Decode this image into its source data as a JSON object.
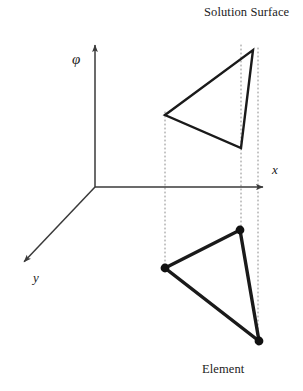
{
  "figure": {
    "width": 303,
    "height": 391,
    "background": "#ffffff",
    "line_color": "#1a1a1a",
    "axis_color": "#3a3a3a",
    "dotted_color": "#8a8a8a",
    "node_color": "#111111"
  },
  "labels": {
    "solution_surface": "Solution Surface",
    "element": "Element",
    "axis_phi": "φ",
    "axis_x": "x",
    "axis_y": "y"
  },
  "chart_data": {
    "type": "diagram",
    "title": "Solution Surface",
    "subtitle": "Element",
    "axes": [
      {
        "name": "phi",
        "label": "φ",
        "direction": "up",
        "start": [
          95,
          187
        ],
        "end": [
          95,
          42
        ],
        "label_pos": [
          78,
          62
        ],
        "arrow": true
      },
      {
        "name": "x",
        "label": "x",
        "direction": "right",
        "start": [
          95,
          187
        ],
        "end": [
          266,
          187
        ],
        "label_pos": [
          272,
          171
        ],
        "arrow": true
      },
      {
        "name": "y",
        "label": "y",
        "direction": "down-left",
        "start": [
          95,
          187
        ],
        "end": [
          22,
          264
        ],
        "label_pos": [
          37,
          271
        ],
        "arrow": true
      }
    ],
    "origin": [
      95,
      187
    ],
    "solution_surface_triangle": {
      "label": "Solution Surface",
      "stroke_width": 2.4,
      "filled": false,
      "vertices": [
        {
          "name": "left",
          "x": 165,
          "y": 115
        },
        {
          "name": "top-right",
          "x": 253,
          "y": 50
        },
        {
          "name": "bottom",
          "x": 241,
          "y": 148
        }
      ]
    },
    "element_triangle": {
      "label": "Element",
      "stroke_width": 3.4,
      "filled": false,
      "nodes_visible": true,
      "node_radius": 4.4,
      "vertices": [
        {
          "name": "node-left",
          "x": 165,
          "y": 268
        },
        {
          "name": "node-top",
          "x": 240,
          "y": 230
        },
        {
          "name": "node-bottom-right",
          "x": 259,
          "y": 341
        }
      ]
    },
    "projection_lines": [
      {
        "name": "projection-left",
        "x": 165,
        "y1": 112,
        "y2": 272
      },
      {
        "name": "projection-middle",
        "x": 241,
        "y1": 45,
        "y2": 234
      },
      {
        "name": "projection-right",
        "x": 258,
        "y1": 48,
        "y2": 345
      }
    ]
  }
}
